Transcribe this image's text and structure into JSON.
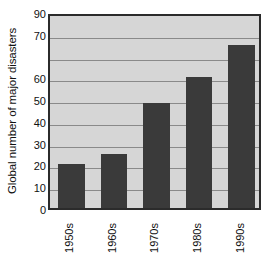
{
  "chart_data": {
    "type": "bar",
    "title": "",
    "xlabel": "",
    "ylabel": "Global number of major disasters",
    "categories": [
      "1950s",
      "1960s",
      "1970s",
      "1980s",
      "1990s"
    ],
    "values": [
      20,
      25,
      48,
      60,
      75
    ],
    "ylim": [
      0,
      90
    ],
    "ytick_values": [
      90,
      80,
      70,
      60,
      50,
      40,
      30,
      20,
      10,
      0
    ],
    "ytick_labels": [
      "90",
      "70",
      "60",
      "50",
      "40",
      "30",
      "20",
      "10",
      "0"
    ],
    "ytick_label_values": [
      90,
      80,
      60,
      50,
      40,
      30,
      20,
      10,
      0
    ],
    "grid": true,
    "grid_axis": "y",
    "grid_interval": 10,
    "legend": "none",
    "orientation": "vertical",
    "xtick_rotation": 90,
    "colors": {
      "bar": "#3a3a3a",
      "plot_background": "#d6d6d6",
      "gridline": "#8a8a8a",
      "frame": "#2b2b2b",
      "text": "#111111",
      "page_background": "#ffffff"
    }
  }
}
